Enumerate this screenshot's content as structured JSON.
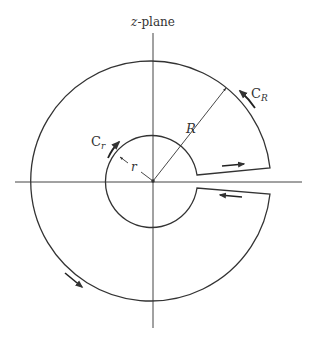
{
  "diagram": {
    "title": "z-plane",
    "title_var": "z",
    "title_rest": "-plane",
    "labels": {
      "outer_contour": "C",
      "outer_contour_sub": "R",
      "inner_contour": "C",
      "inner_contour_sub": "r",
      "outer_radius": "R",
      "inner_radius": "r"
    },
    "geometry": {
      "center": [
        153,
        181
      ],
      "outer_radius_px": 120,
      "inner_radius_px": 46,
      "slit_half_width_px": 7,
      "keyhole_opening": "positive real axis"
    },
    "colors": {
      "stroke": "#333333",
      "background": "#ffffff"
    }
  }
}
